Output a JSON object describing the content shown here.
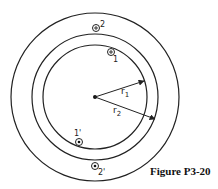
{
  "figure": {
    "caption": "Figure P3-20",
    "center": {
      "x": 95,
      "y": 97
    },
    "circles": [
      {
        "name": "outer",
        "r": 84
      },
      {
        "name": "middle",
        "r": 63
      },
      {
        "name": "inner",
        "r": 52
      }
    ],
    "radius_labels": {
      "r1": "r",
      "r1_sub": "1",
      "r2": "r",
      "r2_sub": "2"
    },
    "conductors": [
      {
        "id": "1",
        "label": "1",
        "symbol": "cross",
        "direction": "into page"
      },
      {
        "id": "2",
        "label": "2",
        "symbol": "cross",
        "direction": "into page"
      },
      {
        "id": "1'",
        "label": "1'",
        "symbol": "dot",
        "direction": "out of page"
      },
      {
        "id": "2'",
        "label": "2'",
        "symbol": "dot",
        "direction": "out of page"
      }
    ],
    "stroke_color": "#222222",
    "background": "#ffffff"
  }
}
